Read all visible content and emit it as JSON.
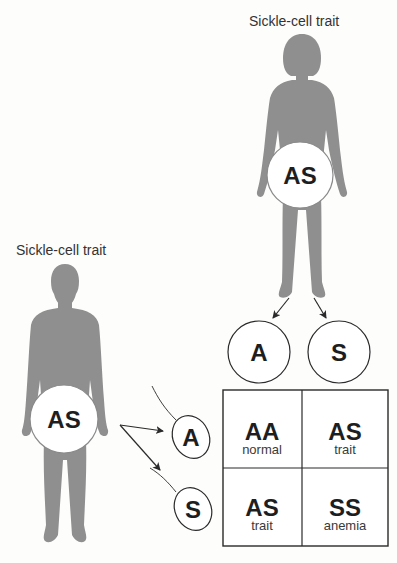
{
  "parents": {
    "mother": {
      "label": "Sickle-cell trait",
      "genotype": "AS"
    },
    "father": {
      "label": "Sickle-cell trait",
      "genotype": "AS"
    }
  },
  "gametes": {
    "eggs": [
      "A",
      "S"
    ],
    "sperm": [
      "A",
      "S"
    ]
  },
  "punnett_square": {
    "rows": [
      [
        {
          "genotype": "AA",
          "phenotype": "normal"
        },
        {
          "genotype": "AS",
          "phenotype": "trait"
        }
      ],
      [
        {
          "genotype": "AS",
          "phenotype": "trait"
        },
        {
          "genotype": "SS",
          "phenotype": "anemia"
        }
      ]
    ]
  },
  "colors": {
    "silhouette": "#8f8f8f",
    "line": "#2a2a2a",
    "background": "#fdfdfc"
  }
}
